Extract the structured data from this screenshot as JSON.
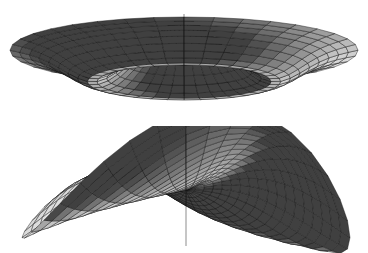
{
  "figure": {
    "background_color": "#ffffff",
    "render_style": "shaded-wireframe-grayscale",
    "mesh_line_color": "#141414",
    "shading_light_gray": "#ebebeb",
    "shading_dark_gray": "#262626",
    "panel_count": 2,
    "layout": "two panels stacked vertically"
  },
  "chart_data": [
    {
      "id": "top-surface",
      "type": "surface3d",
      "title": "",
      "subtitle": "",
      "xlabel": "",
      "ylabel": "",
      "zlabel": "",
      "description": "Axisymmetric volcano / sombrero surface: central conical peak rising out of a deep dark annular trough, surrounded by a wide brim that flares upward toward the rim.",
      "surface_equation": "z(r) = peak*exp(-(r/0.30)^2)*1.0 - trough*exp(-((r-0.52)/0.22)^2) + brim*(r^2)",
      "coordinate_system": "polar",
      "domain": {
        "r": [
          0,
          1
        ],
        "theta_degrees": [
          0,
          360
        ]
      },
      "mesh": {
        "radial_lines": 36,
        "ring_lines": 18,
        "grid": true
      },
      "camera": {
        "azimuth_degrees": 0,
        "elevation_degrees": 11,
        "projection": "orthographic"
      },
      "extents_px": {
        "x": [
          10,
          358
        ],
        "y": [
          12,
          106
        ]
      },
      "zlim": [
        -0.42,
        1.0
      ],
      "radial_profile": {
        "r": [
          0.0,
          0.06,
          0.12,
          0.18,
          0.24,
          0.3,
          0.36,
          0.42,
          0.48,
          0.54,
          0.6,
          0.66,
          0.72,
          0.78,
          0.84,
          0.9,
          0.95,
          1.0
        ],
        "z": [
          1.0,
          0.95,
          0.82,
          0.62,
          0.38,
          0.14,
          -0.08,
          -0.24,
          -0.33,
          -0.35,
          -0.3,
          -0.2,
          -0.08,
          0.04,
          0.14,
          0.22,
          0.27,
          0.3
        ]
      },
      "features": [
        {
          "name": "central-peak",
          "r": 0.0,
          "z": 1.0
        },
        {
          "name": "annular-trough",
          "r": 0.54,
          "z": -0.35
        },
        {
          "name": "outer-rim",
          "r": 1.0,
          "z": 0.3
        }
      ]
    },
    {
      "id": "bottom-surface",
      "type": "surface3d",
      "title": "",
      "subtitle": "",
      "xlabel": "",
      "ylabel": "",
      "zlabel": "",
      "description": "Four-lobed twisted saddle surface: amplitude grows with radius and the phase twists with radius, producing two raised lobes (back-left, front-right) and two lowered lobes, with a dark twisted vortex singularity at the centre.",
      "surface_equation": "z(r,theta) = A*r^1.15*cos(2*theta + k*r)",
      "coordinate_system": "polar",
      "domain": {
        "r": [
          0,
          1
        ],
        "theta_degrees": [
          0,
          360
        ]
      },
      "mesh": {
        "radial_lines": 36,
        "ring_lines": 18,
        "grid": true
      },
      "camera": {
        "azimuth_degrees": 0,
        "elevation_degrees": 11,
        "projection": "orthographic"
      },
      "extents_px": {
        "x": [
          22,
          350
        ],
        "y": [
          133,
          242
        ]
      },
      "zlim": [
        -1.0,
        1.0
      ],
      "parameters": {
        "A": 1.0,
        "twist_k_radians": 2.1,
        "lobes": 4
      },
      "features": [
        {
          "name": "lobe-up-back-left",
          "theta_degrees": 160,
          "z": 1.0
        },
        {
          "name": "lobe-up-front-right",
          "theta_degrees": 340,
          "z": 1.0
        },
        {
          "name": "lobe-down-back-right",
          "theta_degrees": 70,
          "z": -1.0
        },
        {
          "name": "lobe-down-front-left",
          "theta_degrees": 250,
          "z": -1.0
        },
        {
          "name": "central-vortex",
          "r": 0.0,
          "z": 0.0
        }
      ]
    }
  ]
}
